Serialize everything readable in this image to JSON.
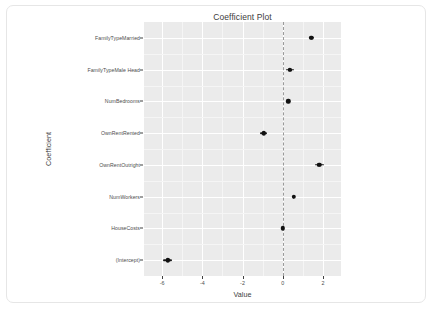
{
  "chart_data": {
    "type": "scatter",
    "title": "Coefficient Plot",
    "xlabel": "Value",
    "ylabel": "Coefficient",
    "xlim": [
      -6.9,
      2.9
    ],
    "grid": true,
    "legend": null,
    "zero_reference_line": 0,
    "x_ticks": [
      {
        "value": -6,
        "label": "-6"
      },
      {
        "value": -4,
        "label": "-4"
      },
      {
        "value": -2,
        "label": "-2"
      },
      {
        "value": 0,
        "label": "0"
      },
      {
        "value": 2,
        "label": "2"
      }
    ],
    "categories": [
      "FamilyTypeMarried",
      "FamilyTypeMale Head",
      "NumBedrooms",
      "OwnRentRented",
      "OwnRentOutright",
      "NumWorkers",
      "HouseCosts",
      "(Intercept)"
    ],
    "points": [
      {
        "label": "FamilyTypeMarried",
        "estimate": 1.42,
        "inner_low": 1.36,
        "inner_high": 1.49,
        "outer_low": 1.3,
        "outer_high": 1.55
      },
      {
        "label": "FamilyTypeMale Head",
        "estimate": 0.35,
        "inner_low": 0.25,
        "inner_high": 0.45,
        "outer_low": 0.14,
        "outer_high": 0.56
      },
      {
        "label": "NumBedrooms",
        "estimate": 0.28,
        "inner_low": 0.25,
        "inner_high": 0.31,
        "outer_low": 0.22,
        "outer_high": 0.34
      },
      {
        "label": "OwnRentRented",
        "estimate": -0.95,
        "inner_low": -1.03,
        "inner_high": -0.87,
        "outer_low": -1.11,
        "outer_high": -0.79
      },
      {
        "label": "OwnRentOutright",
        "estimate": 1.82,
        "inner_low": 1.72,
        "inner_high": 1.92,
        "outer_low": 1.6,
        "outer_high": 2.04
      },
      {
        "label": "NumWorkers",
        "estimate": 0.55,
        "inner_low": 0.52,
        "inner_high": 0.58,
        "outer_low": 0.49,
        "outer_high": 0.61
      },
      {
        "label": "HouseCosts",
        "estimate": 0.0,
        "inner_low": -0.02,
        "inner_high": 0.02,
        "outer_low": -0.04,
        "outer_high": 0.04
      },
      {
        "label": "(Intercept)",
        "estimate": -5.72,
        "inner_low": -5.83,
        "inner_high": -5.61,
        "outer_low": -5.95,
        "outer_high": -5.49
      }
    ],
    "colors": {
      "panel_background": "#ebebeb",
      "grid_major": "#ffffff",
      "grid_minor": "#f5f5f5",
      "point": "#111111",
      "zero_line": "#9a9a9a",
      "text": "#4d4d4d",
      "card_background": "#ffffff",
      "card_border": "#e6e6e6"
    }
  }
}
